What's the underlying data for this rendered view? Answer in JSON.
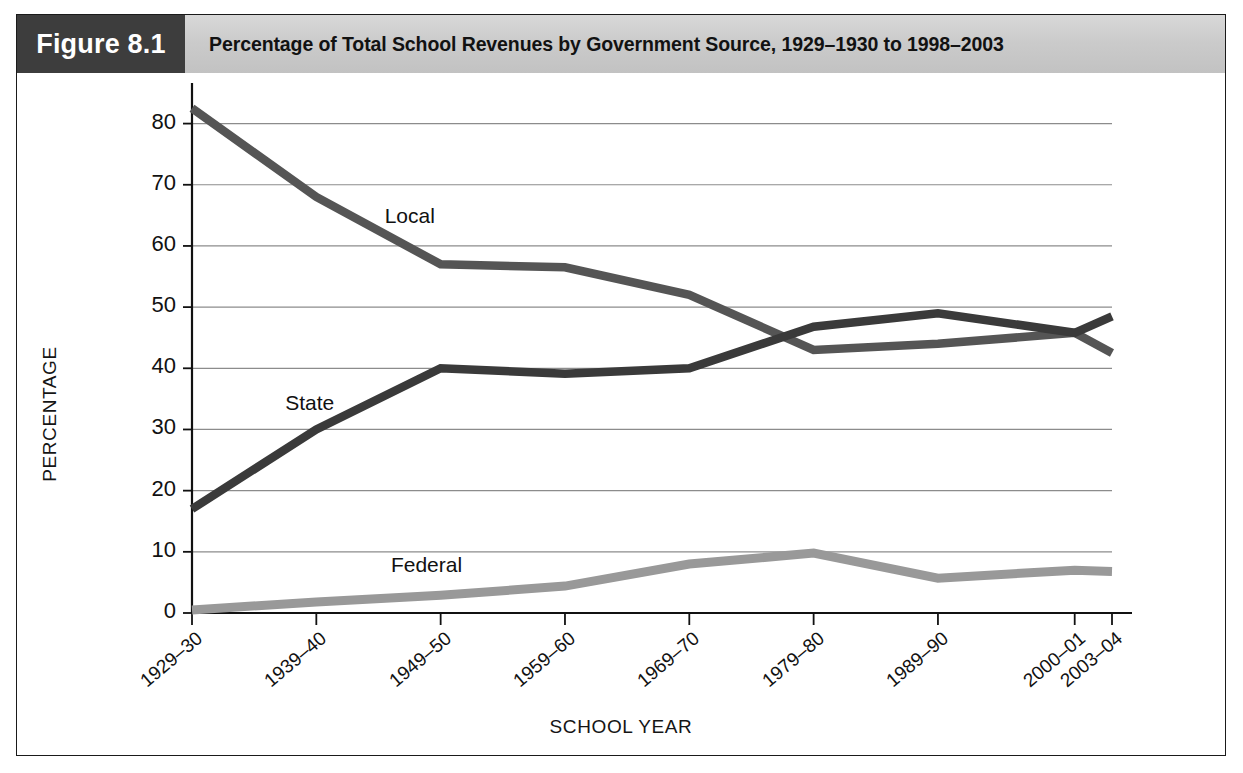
{
  "figure": {
    "number_label": "Figure 8.1",
    "title": "Percentage of Total School Revenues by Government Source, 1929–1930 to 1998–2003"
  },
  "chart_data": {
    "type": "line",
    "title": "Percentage of Total School Revenues by Government Source, 1929–1930 to 1998–2003",
    "xlabel": "SCHOOL YEAR",
    "ylabel": "PERCENTAGE",
    "categories": [
      "1929–30",
      "1939–40",
      "1949–50",
      "1959–60",
      "1969–70",
      "1979–80",
      "1989–90",
      "2000–01",
      "2003–04"
    ],
    "x_positions": [
      0,
      10,
      20,
      30,
      40,
      50,
      60,
      71,
      74
    ],
    "xlim": [
      0,
      74
    ],
    "ylim": [
      0,
      85
    ],
    "yticks": [
      0,
      10,
      20,
      30,
      40,
      50,
      60,
      70,
      80
    ],
    "ytick_labels": [
      "0",
      "10",
      "20",
      "30",
      "40",
      "50",
      "60",
      "70",
      "80"
    ],
    "grid": "horizontal",
    "legend": "inline-labels",
    "series": [
      {
        "name": "Local",
        "color": "#555555",
        "values": [
          82.5,
          68.0,
          57.0,
          56.5,
          52.0,
          43.0,
          44.0,
          45.8,
          42.5
        ]
      },
      {
        "name": "State",
        "color": "#3a3a3a",
        "values": [
          17.0,
          30.0,
          40.0,
          39.1,
          40.0,
          46.8,
          49.0,
          45.8,
          48.5
        ]
      },
      {
        "name": "Federal",
        "color": "#999999",
        "values": [
          0.5,
          1.8,
          2.9,
          4.4,
          8.0,
          9.8,
          5.7,
          7.0,
          6.8
        ]
      }
    ],
    "annotations": [
      {
        "text": "Local",
        "x": 15.5,
        "y": 64.5
      },
      {
        "text": "State",
        "x": 7.5,
        "y": 34.0
      },
      {
        "text": "Federal",
        "x": 16.0,
        "y": 7.6
      }
    ]
  }
}
